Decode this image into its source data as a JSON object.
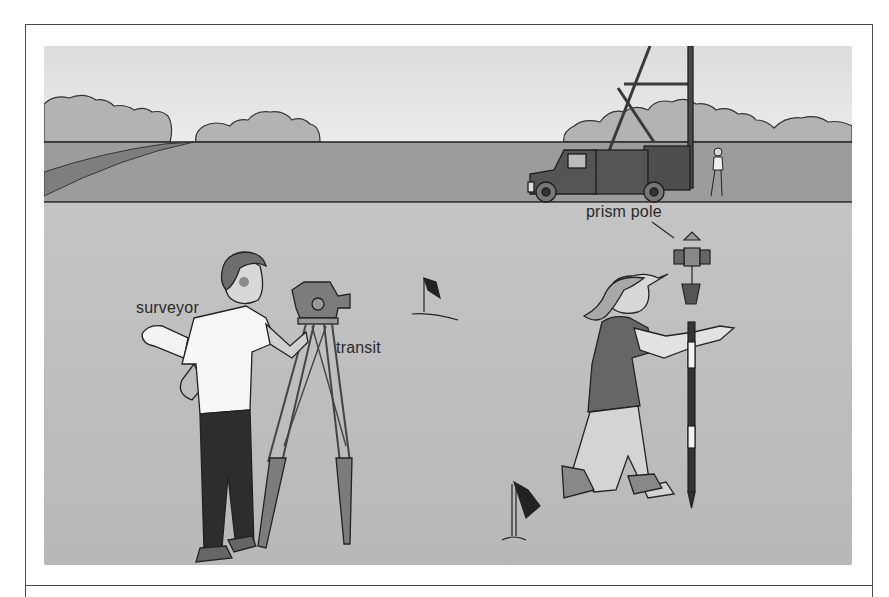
{
  "figure": {
    "labels": {
      "surveyor": "surveyor",
      "transit": "transit",
      "prism_pole": "prism pole"
    }
  },
  "colors": {
    "page_background": "#ffffff",
    "frame_line": "#4a4a4a",
    "sky": "#e2e2e2",
    "field_far": "#9a9a9a",
    "field_near": "#bdbdbd",
    "outline": "#222222"
  }
}
